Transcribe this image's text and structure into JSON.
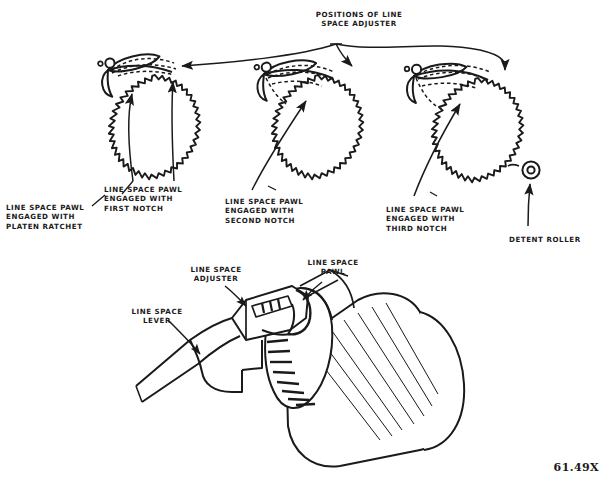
{
  "figure": {
    "number": "61.49X",
    "ink_color": "#1a1a1a",
    "background_color": "#ffffff"
  },
  "top_diagram": {
    "header_label": "POSITIONS OF LINE\nSPACE ADJUSTER",
    "header_label_lines": [
      "POSITIONS OF LINE",
      "SPACE ADJUSTER"
    ],
    "mechanisms": [
      {
        "index": 1,
        "name": "ratchet-assembly-first",
        "caption_lines": [
          "LINE SPACE PAWL",
          "ENGAGED WITH",
          "PLATEN RATCHET"
        ],
        "secondary_caption_lines": [
          "LINE SPACE PAWL",
          "ENGAGED WITH",
          "FIRST NOTCH"
        ]
      },
      {
        "index": 2,
        "name": "ratchet-assembly-second",
        "caption_lines": [
          "LINE SPACE PAWL",
          "ENGAGED WITH",
          "SECOND NOTCH"
        ]
      },
      {
        "index": 3,
        "name": "ratchet-assembly-third",
        "caption_lines": [
          "LINE SPACE PAWL",
          "ENGAGED WITH",
          "THIRD NOTCH"
        ],
        "detent_label": "DETENT ROLLER"
      }
    ]
  },
  "bottom_diagram": {
    "name": "platen-assembly-perspective",
    "labels": [
      {
        "id": "line-space-adjuster",
        "lines": [
          "LINE SPACE",
          "ADJUSTER"
        ]
      },
      {
        "id": "line-space-pawl",
        "lines": [
          "LINE SPACE",
          "PAWL"
        ]
      },
      {
        "id": "line-space-lever",
        "lines": [
          "LINE SPACE",
          "LEVER"
        ]
      }
    ]
  }
}
